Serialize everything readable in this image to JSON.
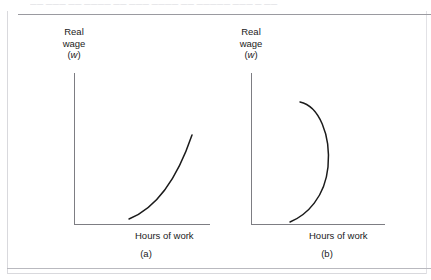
{
  "scan": {
    "header_text": "—— ——— —— ———— —— ——— ———— —— ————— ——— — ——"
  },
  "figure": {
    "line_color": "#1b1b1b",
    "axis_color": "#7d7d83",
    "frame_color": "#d9d9dd",
    "background": "#ffffff"
  },
  "panels": [
    {
      "id": "a",
      "caption": "(a)",
      "y_axis": {
        "line1": "Real",
        "line2": "wage",
        "line3_open": "(",
        "line3_symbol": "w",
        "line3_close": ")"
      },
      "x_axis": {
        "label": "Hours of work"
      },
      "curve": {
        "name": "upward-sloping-labor-supply-curve",
        "shape": "increasing-convex",
        "path": "M 55 146 C 75 138, 99 118, 118 62"
      }
    },
    {
      "id": "b",
      "caption": "(b)",
      "y_axis": {
        "line1": "Real",
        "line2": "wage",
        "line3_open": "(",
        "line3_symbol": "w",
        "line3_close": ")"
      },
      "x_axis": {
        "label": "Hours of work"
      },
      "curve": {
        "name": "backward-bending-labor-supply-curve",
        "shape": "backward-bending",
        "path": "M 49 29 C 68 33, 80 62, 77 94 C 74 124, 56 142, 39 149"
      }
    }
  ],
  "chart_data": {
    "type": "line",
    "title": "",
    "xlabel": "Hours of work",
    "ylabel": "Real wage (w)",
    "grid": false,
    "legend": "none",
    "xlim": [
      0,
      1
    ],
    "ylim": [
      0,
      1
    ],
    "panels": [
      {
        "label": "(a)",
        "series_name": "upward-sloping labour supply",
        "description": "Real wage rises continuously as hours of work increase; curve is convex and slopes upward to the right.",
        "points": [
          {
            "x": 0.27,
            "y": 0.04
          },
          {
            "x": 0.4,
            "y": 0.1
          },
          {
            "x": 0.55,
            "y": 0.22
          },
          {
            "x": 0.7,
            "y": 0.4
          },
          {
            "x": 0.82,
            "y": 0.58
          },
          {
            "x": 0.9,
            "y": 0.74
          }
        ]
      },
      {
        "label": "(b)",
        "series_name": "backward-bending labour supply",
        "description": "Hours of work first increase with the real wage, reach a maximum, then decrease as the real wage rises further.",
        "points": [
          {
            "x": 0.22,
            "y": 0.02
          },
          {
            "x": 0.37,
            "y": 0.14
          },
          {
            "x": 0.52,
            "y": 0.32
          },
          {
            "x": 0.58,
            "y": 0.5
          },
          {
            "x": 0.56,
            "y": 0.66
          },
          {
            "x": 0.48,
            "y": 0.8
          },
          {
            "x": 0.34,
            "y": 0.88
          }
        ]
      }
    ]
  }
}
